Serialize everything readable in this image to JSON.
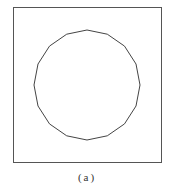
{
  "figure": {
    "caption": "(a)",
    "frame": {
      "x": 13,
      "y": 7,
      "width": 148,
      "height": 155,
      "stroke": "#555555"
    },
    "polygon": {
      "sides": 16,
      "center": [
        87,
        85
      ],
      "radius_x": 53,
      "radius_y": 55,
      "stroke": "#444444"
    }
  }
}
